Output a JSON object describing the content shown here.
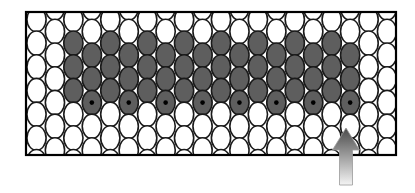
{
  "diagram": {
    "description": "Honeycomb-like grid of ellipses inside a rectangular frame, with a block of dark-gray ellipses in the middle, a black dot marking the bottom dark ellipse of every other column, and an upward arrow pointing at the right-most marked ellipse.",
    "frame": {
      "x": 26,
      "y": 12,
      "width": 370,
      "height": 143,
      "stroke": "#000000",
      "stroke_width": 2.2
    },
    "grid": {
      "first_column_x": 36.5,
      "column_spacing": 18.45,
      "column_count": 20,
      "ellipse_rx": 9.6,
      "ellipse_ry": 12.2,
      "row_spacing": 23.7,
      "high_column_first_y": 19.5,
      "low_column_first_y": 7.8,
      "rows_per_column": 7,
      "outline_color": "#1a1a1a",
      "outline_width": 1.6,
      "light_fill": "#ffffff",
      "dark_fill": "#5e5e5e",
      "dot_color": "#000000",
      "dot_radius": 2.3
    },
    "dark_region": {
      "high_columns": [
        2,
        4,
        6,
        8,
        10,
        12,
        14,
        16
      ],
      "high_dark_rows": [
        1,
        2,
        3
      ],
      "low_columns": [
        3,
        5,
        7,
        9,
        11,
        13,
        15,
        17
      ],
      "low_dark_rows": [
        2,
        3,
        4
      ],
      "low_dot_row": 4
    },
    "arrow": {
      "tip_x": 346,
      "tip_y": 128,
      "head_half_width": 13.5,
      "head_base_y": 150,
      "shaft_half_width": 6.5,
      "bottom_y": 185,
      "gradient_top": "#4a4a4a",
      "gradient_bottom": "#f4f4f4",
      "stroke": "#9a9a9a"
    }
  }
}
